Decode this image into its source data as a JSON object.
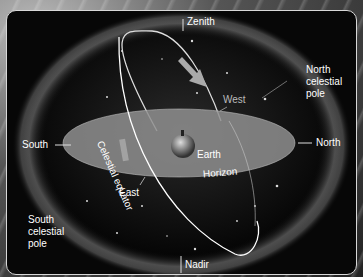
{
  "diagram": {
    "labels": {
      "zenith": "Zenith",
      "nadir": "Nadir",
      "north": "North",
      "south": "South",
      "east": "East",
      "west": "West",
      "earth": "Earth",
      "horizon": "Horizon",
      "celestial_equator": "Celestial equator",
      "north_celestial_pole": [
        "North",
        "celestial",
        "pole"
      ],
      "south_celestial_pole": [
        "South",
        "celestial",
        "pole"
      ]
    },
    "colors": {
      "panel_bg": "#070707",
      "sphere_glow": "#9a9a9a",
      "horizon_plane": "#8f8f8f",
      "text": "#ffffff"
    }
  }
}
